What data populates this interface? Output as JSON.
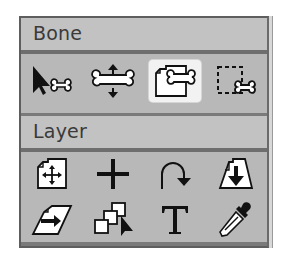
{
  "panel": {
    "sections": [
      {
        "title": "Bone",
        "tools": [
          {
            "name": "select-bone",
            "icon": "arrow-bone-icon",
            "selected": false
          },
          {
            "name": "translate-bone",
            "icon": "bone-arrows-icon",
            "selected": false
          },
          {
            "name": "bind-layer",
            "icon": "layer-bone-icon",
            "selected": true
          },
          {
            "name": "bind-points",
            "icon": "dashed-box-bone-icon",
            "selected": false
          }
        ]
      },
      {
        "title": "Layer",
        "tools": [
          {
            "name": "translate-layer",
            "icon": "layer-move-icon",
            "selected": false
          },
          {
            "name": "set-origin",
            "icon": "crosshair-icon",
            "selected": false
          },
          {
            "name": "rotate-layer",
            "icon": "rotate-arrow-icon",
            "selected": false
          },
          {
            "name": "scale-layer",
            "icon": "layer-scale-down-icon",
            "selected": false
          },
          {
            "name": "shear-layer",
            "icon": "layer-shear-icon",
            "selected": false
          },
          {
            "name": "select-layers",
            "icon": "stacked-layers-arrow-icon",
            "selected": false
          },
          {
            "name": "text-tool",
            "icon": "text-t-icon",
            "selected": false
          },
          {
            "name": "eyedropper",
            "icon": "eyedropper-icon",
            "selected": false
          }
        ]
      }
    ]
  },
  "colors": {
    "panel_bg": "#b8b8b8",
    "header_bg": "#c2c2c2",
    "separator": "#6e6e6e",
    "selected_bg": "#f2f2f2",
    "icon": "#111111"
  }
}
